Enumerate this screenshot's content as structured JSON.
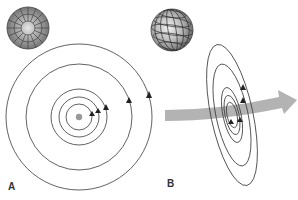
{
  "figure": {
    "panels": [
      {
        "label": "A",
        "description": "Concentric circular orbits viewed face-on with counter-clockwise direction arrows",
        "sphere": "sphere-viewed-from-pole",
        "circle_radii": [
          73,
          53,
          28,
          20,
          13
        ],
        "center_dot": true
      },
      {
        "label": "B",
        "description": "Same orbits viewed obliquely as tilted ellipses, with broad gray arrow passing through",
        "sphere": "sphere-viewed-obliquely",
        "ellipse_radii": [
          [
            21,
            72
          ],
          [
            16,
            52
          ],
          [
            9,
            28
          ],
          [
            7,
            20
          ],
          [
            5,
            13
          ]
        ],
        "gray_arrow": true
      }
    ]
  },
  "colors": {
    "line": "#3a3a3a",
    "sphere_dark": "#6f6f6f",
    "sphere_light": "#d9d9d9",
    "center_dot": "#999999",
    "gray_arrow": "#b3b3b3"
  }
}
